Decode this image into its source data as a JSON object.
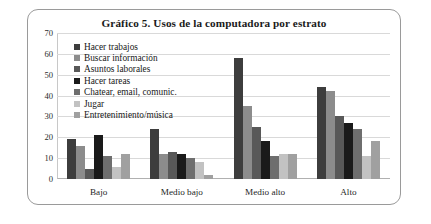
{
  "chart_data": {
    "type": "bar",
    "title": "Gráfico 5. Usos de la computadora por estrato",
    "xlabel": "",
    "ylabel": "",
    "ylim": [
      0,
      70
    ],
    "yticks": [
      0,
      10,
      20,
      30,
      40,
      50,
      60,
      70
    ],
    "grid": true,
    "legend_position": "top-left",
    "categories": [
      "Bajo",
      "Medio bajo",
      "Medio alto",
      "Alto"
    ],
    "series": [
      {
        "name": "Hacer trabajos",
        "color": "#3d3d3d",
        "values": [
          19,
          24,
          58,
          44
        ]
      },
      {
        "name": "Buscar información",
        "color": "#8c8c8c",
        "values": [
          16,
          12,
          35,
          42
        ]
      },
      {
        "name": "Asuntos laborales",
        "color": "#585858",
        "values": [
          5,
          13,
          25,
          30
        ]
      },
      {
        "name": "Hacer tareas",
        "color": "#1a1a1a",
        "values": [
          21,
          12,
          18,
          27
        ]
      },
      {
        "name": "Chatear, email, comunic.",
        "color": "#6e6e6e",
        "values": [
          11,
          10,
          11,
          24
        ]
      },
      {
        "name": "Jugar",
        "color": "#c2c2c2",
        "values": [
          6,
          8,
          12,
          11
        ]
      },
      {
        "name": "Entretenimiento/música",
        "color": "#a0a0a0",
        "values": [
          12,
          2,
          12,
          18
        ]
      }
    ]
  }
}
